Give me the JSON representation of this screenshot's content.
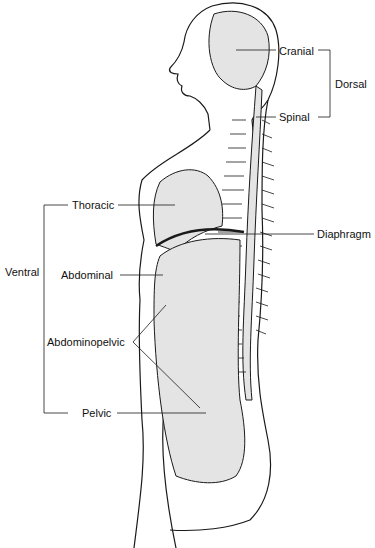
{
  "diagram": {
    "labels": {
      "cranial": "Cranial",
      "dorsal": "Dorsal",
      "spinal": "Spinal",
      "thoracic": "Thoracic",
      "diaphragm": "Diaphragm",
      "ventral": "Ventral",
      "abdominal": "Abdominal",
      "abdominopelvic": "Abdominopelvic",
      "pelvic": "Pelvic"
    },
    "groups": {
      "dorsal": [
        "Cranial",
        "Spinal"
      ],
      "ventral": [
        "Thoracic",
        "Abdominal",
        "Pelvic"
      ],
      "abdominopelvic": [
        "Abdominal",
        "Pelvic"
      ]
    },
    "colors": {
      "cavity_fill": "#e4e4e4",
      "outline": "#1a1a1a",
      "background": "#ffffff"
    }
  }
}
